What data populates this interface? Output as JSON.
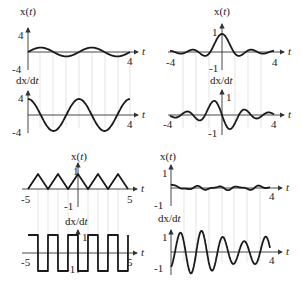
{
  "figure": {
    "colors": {
      "curve": "#1a1a1a",
      "axis": "#333333",
      "guide": "#d4d4d4"
    }
  },
  "chart_data": [
    {
      "panel": "top-left",
      "type": "line",
      "title": "x(t)",
      "xlabel": "t",
      "ylabel": "x(t)",
      "xlim": [
        0,
        4
      ],
      "ylim": [
        -4,
        4
      ],
      "x_ticks": [
        "4"
      ],
      "y_ticks": [
        "4",
        "-4"
      ],
      "description": "small-amplitude sinusoid, period ~2",
      "series": [
        {
          "name": "x(t)",
          "fn": "sin",
          "amp": 1.1,
          "period": 2.0,
          "phase": 0
        }
      ],
      "derivative": {
        "ylabel": "dx/dt",
        "xlabel": "t",
        "ylim": [
          -4,
          4
        ],
        "x_ticks": [
          "4"
        ],
        "y_ticks": [
          "4",
          "-4"
        ],
        "series": [
          {
            "name": "dx/dt",
            "fn": "cos",
            "amp": 3.4,
            "period": 2.0,
            "phase": 0
          }
        ]
      }
    },
    {
      "panel": "top-right",
      "type": "line",
      "title": "x(t)",
      "xlabel": "t",
      "ylabel": "x(t)",
      "xlim": [
        -4,
        4
      ],
      "ylim": [
        -1,
        1
      ],
      "x_ticks": [
        "-4",
        "4"
      ],
      "y_ticks": [
        "1",
        "-1"
      ],
      "description": "sinc-like pulse centered at t=0",
      "series": [
        {
          "name": "x(t)",
          "fn": "sinc",
          "amp": 1.0
        }
      ],
      "derivative": {
        "ylabel": "dx/dt",
        "xlabel": "t",
        "ylim": [
          -1,
          1
        ],
        "x_ticks": [
          "-4",
          "4"
        ],
        "y_ticks": [
          "1",
          "-1"
        ],
        "series": [
          {
            "name": "dx/dt",
            "fn": "dsinc",
            "amp": 1.0
          }
        ]
      }
    },
    {
      "panel": "bottom-left",
      "type": "line",
      "title": "x(t)",
      "xlabel": "t",
      "ylabel": "x(t)",
      "xlim": [
        -5,
        5
      ],
      "ylim": [
        -1,
        1
      ],
      "x_ticks": [
        "-5",
        "5"
      ],
      "y_ticks": [
        "1",
        "-1"
      ],
      "description": "triangle wave between 0 and 1, period 2, peaks at odd... peak at t=0",
      "series": [
        {
          "name": "x(t)",
          "fn": "triangle",
          "amp": 1.0,
          "period": 2.0
        }
      ],
      "derivative": {
        "ylabel": "dx/dt",
        "xlabel": "t",
        "ylim": [
          -1,
          1
        ],
        "x_ticks": [
          "-5",
          "5"
        ],
        "y_ticks": [
          "1",
          "-1"
        ],
        "series": [
          {
            "name": "dx/dt",
            "fn": "square",
            "amp": 1.0,
            "period": 2.0
          }
        ]
      }
    },
    {
      "panel": "bottom-right",
      "type": "line",
      "title": "x(t)",
      "xlabel": "t",
      "ylabel": "x(t)",
      "xlim": [
        0,
        4
      ],
      "ylim": [
        -1,
        1
      ],
      "x_ticks": [
        "4"
      ],
      "y_ticks": [
        "1",
        "-1"
      ],
      "description": "small noisy oscillation near zero",
      "series": [
        {
          "name": "x(t)",
          "fn": "noise",
          "amp": 0.2
        }
      ],
      "derivative": {
        "ylabel": "dx/dt",
        "xlabel": "t",
        "ylim": [
          -1,
          1
        ],
        "x_ticks": [
          "4"
        ],
        "y_ticks": [
          "1",
          "-1"
        ],
        "series": [
          {
            "name": "dx/dt",
            "fn": "dnoise",
            "amp": 1.0
          }
        ]
      }
    }
  ],
  "labels": {
    "x_of_t": "x(",
    "t": "t",
    "close": ")",
    "dxdt": "dx/d",
    "tl": {
      "xt_top": "4",
      "xt_bot": "-4",
      "xt_end": "4",
      "dx_top": "4",
      "dx_bot": "-4",
      "dx_end": "4"
    },
    "tr": {
      "xt_top": "1",
      "xt_bot": "-1",
      "xt_start": "-4",
      "xt_end": "4",
      "dx_top": "1",
      "dx_bot": "-1",
      "dx_start": "-4",
      "dx_end": "4"
    },
    "bl": {
      "xt_top": "1",
      "xt_bot": "-1",
      "xt_start": "-5",
      "xt_end": "5",
      "dx_top": "1",
      "dx_bot": "-1",
      "dx_start": "-5",
      "dx_end": "5"
    },
    "br": {
      "xt_top": "1",
      "xt_bot": "-1",
      "xt_end": "4",
      "dx_top": "1",
      "dx_bot": "-1",
      "dx_end": "4"
    }
  }
}
